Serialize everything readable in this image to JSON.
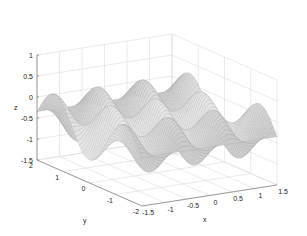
{
  "chart_data": {
    "type": "surface3d",
    "title": "",
    "xlabel": "x",
    "ylabel": "y",
    "zlabel": "z",
    "xlim": [
      -1.5,
      1.5
    ],
    "ylim": [
      -2,
      2
    ],
    "zlim": [
      -1.5,
      1
    ],
    "x_ticks": [
      "-1.5",
      "-1",
      "-0.5",
      "0",
      "0.5",
      "1",
      "1.5"
    ],
    "y_ticks": [
      "2",
      "1",
      "0",
      "-1",
      "-2"
    ],
    "z_ticks": [
      "1",
      "0.5",
      "0",
      "-0.5",
      "-1",
      "-1.5"
    ],
    "grid": true,
    "colormap": "gray",
    "approx_peak_z": 0.6,
    "approx_trough_z": -1.35
  }
}
